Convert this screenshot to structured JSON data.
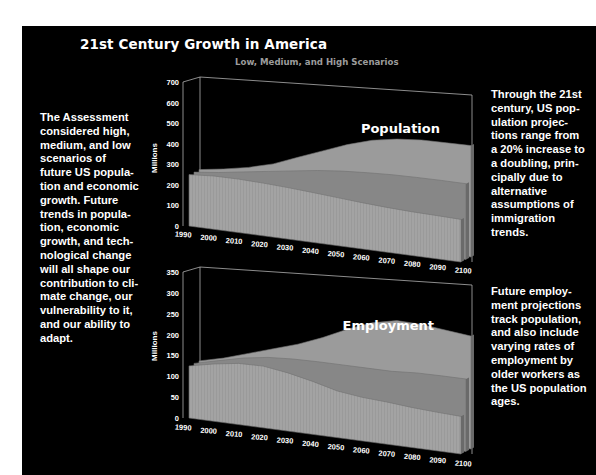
{
  "title": "21st Century Growth in America",
  "subtitle": "Low, Medium, and High Scenarios",
  "left_text": "The Assessment\nconsidered high,\nmedium, and low\nscenarios of\nfuture US popula-\ntion and economic\ngrowth. Future\ntrends in popula-\ntion, economic\ngrowth, and tech-\nnological change\nwill all shape our\ncontribution to cli-\nmate change, our\nvulnerability to it,\nand our ability to\nadapt.",
  "right_text_population": "Through the 21st\ncentury, US pop-\nulation projec-\ntions range from\na 20% increase to\na doubling, prin-\ncipally due to\nalternative\nassumptions of\nimmigration\ntrends.",
  "right_text_employment": "Future employ-\nment projections\ntrack population,\nand also include\nvarying rates of\nemployment by\nolder workers as\nthe US population\nages.",
  "colors": {
    "background": "#000000",
    "page": "#ffffff",
    "high": "#9b9b9b",
    "medium": "#878787",
    "low": "#a3a3a3",
    "subtitle": "#9c9c9c"
  },
  "chart_data": [
    {
      "type": "area",
      "title": "Population",
      "xlabel": "",
      "ylabel": "Millions",
      "ylim": [
        0,
        700
      ],
      "yticks": [
        "0",
        "100",
        "200",
        "300",
        "400",
        "500",
        "600",
        "700"
      ],
      "categories": [
        "1990",
        "2000",
        "2010",
        "2020",
        "2030",
        "2040",
        "2050",
        "2060",
        "2070",
        "2080",
        "2090",
        "2100"
      ],
      "series": [
        {
          "name": "High",
          "values": [
            250,
            270,
            295,
            330,
            380,
            430,
            480,
            520,
            545,
            560,
            565,
            570
          ]
        },
        {
          "name": "Medium",
          "values": [
            250,
            265,
            285,
            305,
            325,
            345,
            360,
            370,
            378,
            383,
            386,
            388
          ]
        },
        {
          "name": "Low",
          "values": [
            250,
            260,
            262,
            260,
            255,
            248,
            240,
            232,
            226,
            222,
            220,
            218
          ]
        }
      ],
      "grid": false,
      "style": "3D stacked-depth area"
    },
    {
      "type": "area",
      "title": "Employment",
      "xlabel": "",
      "ylabel": "Millions",
      "ylim": [
        0,
        350
      ],
      "yticks": [
        "0",
        "50",
        "100",
        "150",
        "200",
        "250",
        "300",
        "350"
      ],
      "categories": [
        "1990",
        "2000",
        "2010",
        "2020",
        "2030",
        "2040",
        "2050",
        "2060",
        "2070",
        "2080",
        "2090",
        "2100"
      ],
      "series": [
        {
          "name": "High",
          "values": [
            125,
            140,
            160,
            180,
            200,
            225,
            255,
            280,
            295,
            295,
            290,
            285
          ]
        },
        {
          "name": "Medium",
          "values": [
            125,
            140,
            155,
            165,
            170,
            172,
            173,
            174,
            175,
            180,
            182,
            183
          ]
        },
        {
          "name": "Low",
          "values": [
            125,
            138,
            148,
            150,
            142,
            130,
            115,
            108,
            105,
            100,
            97,
            95
          ]
        }
      ],
      "grid": false,
      "style": "3D stacked-depth area"
    }
  ]
}
